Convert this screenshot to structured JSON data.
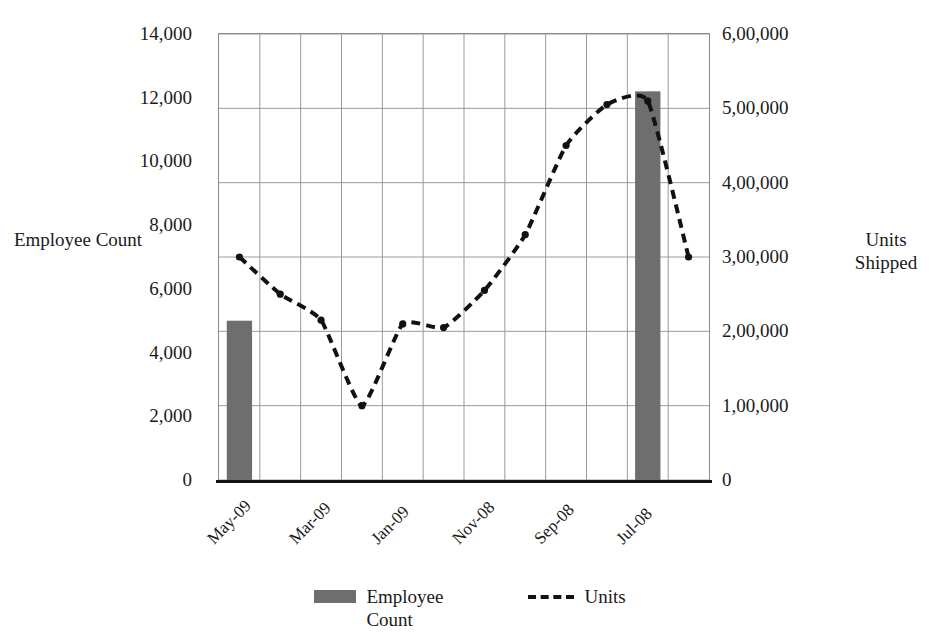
{
  "chart_data": {
    "type": "bar",
    "title": "",
    "subtitle": "",
    "xlabel": "",
    "ylabel": "Employee Count",
    "y2label": "Units Shipped",
    "grid": true,
    "legend_position": "bottom",
    "categories": [
      "May-09",
      "",
      "Mar-09",
      "",
      "Jan-09",
      "",
      "Nov-08",
      "",
      "Sep-08",
      "",
      "Jul-08",
      ""
    ],
    "x_tick_labels": [
      "May-09",
      "Mar-09",
      "Jan-09",
      "Nov-08",
      "Sep-08",
      "Jul-08"
    ],
    "x_tick_indices": [
      0,
      2,
      4,
      6,
      8,
      10
    ],
    "y_left": {
      "label": "Employee Count",
      "ticks": [
        0,
        2000,
        4000,
        6000,
        8000,
        10000,
        12000,
        14000
      ],
      "tick_labels": [
        "0",
        "2,000",
        "4,000",
        "6,000",
        "8,000",
        "10,000",
        "12,000",
        "14,000"
      ],
      "ylim": [
        0,
        14000
      ]
    },
    "y_right": {
      "label": "Units Shipped",
      "ticks": [
        0,
        100000,
        200000,
        300000,
        400000,
        500000,
        600000
      ],
      "tick_labels": [
        "0",
        "1,00,000",
        "2,00,000",
        "3,00,000",
        "4,00,000",
        "5,00,000",
        "6,00,000"
      ],
      "ylim": [
        0,
        600000
      ]
    },
    "series": [
      {
        "name": "Employee Count",
        "type": "bar",
        "axis": "left",
        "color": "#6e6e6e",
        "values": [
          5000,
          null,
          null,
          null,
          null,
          null,
          null,
          null,
          null,
          null,
          12200,
          null
        ]
      },
      {
        "name": "Units",
        "type": "line",
        "axis": "right",
        "color": "#111111",
        "style": "dashed",
        "marker": "circle",
        "values": [
          300000,
          250000,
          215000,
          100000,
          210000,
          205000,
          255000,
          330000,
          450000,
          505000,
          510000,
          300000
        ]
      }
    ]
  },
  "legend": {
    "items": [
      {
        "label": "Employee Count",
        "marker": "bar-swatch"
      },
      {
        "label": "Units",
        "marker": "dashed-line"
      }
    ]
  },
  "colors": {
    "bar": "#6e6e6e",
    "line": "#111111",
    "grid": "#9a9a9a",
    "axis": "#111111",
    "text": "#1a1a1a",
    "background": "#ffffff"
  }
}
